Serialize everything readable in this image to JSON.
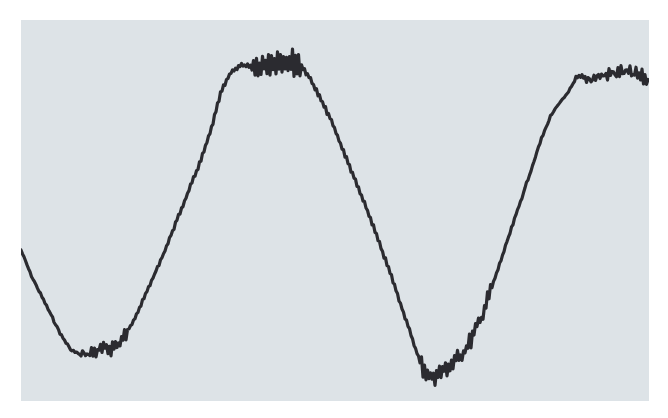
{
  "colors": {
    "page_background": "#ffffff",
    "panel_background": "#dde3e7",
    "trace": "#2b2b30"
  },
  "chart_data": {
    "type": "line",
    "title": "",
    "xlabel": "",
    "ylabel": "",
    "grid": false,
    "legend": null,
    "panel_px": {
      "x": 21,
      "y": 20,
      "width": 628,
      "height": 381
    },
    "series": [
      {
        "name": "trace",
        "points_px": [
          [
            0,
            230
          ],
          [
            10,
            255
          ],
          [
            20,
            275
          ],
          [
            30,
            295
          ],
          [
            40,
            315
          ],
          [
            50,
            330
          ],
          [
            60,
            335
          ],
          [
            70,
            333
          ],
          [
            80,
            330
          ],
          [
            90,
            328
          ],
          [
            100,
            322
          ],
          [
            110,
            305
          ],
          [
            120,
            285
          ],
          [
            130,
            262
          ],
          [
            140,
            240
          ],
          [
            150,
            215
          ],
          [
            160,
            190
          ],
          [
            170,
            165
          ],
          [
            180,
            140
          ],
          [
            190,
            110
          ],
          [
            200,
            72
          ],
          [
            210,
            52
          ],
          [
            220,
            45
          ],
          [
            235,
            48
          ],
          [
            250,
            42
          ],
          [
            265,
            40
          ],
          [
            280,
            45
          ],
          [
            290,
            60
          ],
          [
            300,
            80
          ],
          [
            310,
            100
          ],
          [
            320,
            125
          ],
          [
            330,
            150
          ],
          [
            340,
            175
          ],
          [
            350,
            200
          ],
          [
            360,
            228
          ],
          [
            370,
            255
          ],
          [
            380,
            285
          ],
          [
            390,
            315
          ],
          [
            400,
            345
          ],
          [
            410,
            358
          ],
          [
            420,
            352
          ],
          [
            430,
            345
          ],
          [
            440,
            335
          ],
          [
            450,
            320
          ],
          [
            460,
            298
          ],
          [
            470,
            270
          ],
          [
            480,
            240
          ],
          [
            490,
            210
          ],
          [
            500,
            180
          ],
          [
            510,
            150
          ],
          [
            520,
            120
          ],
          [
            530,
            95
          ],
          [
            545,
            75
          ],
          [
            555,
            60
          ],
          [
            570,
            58
          ],
          [
            585,
            55
          ],
          [
            600,
            52
          ],
          [
            615,
            55
          ],
          [
            628,
            60
          ]
        ],
        "noise_regions_px": [
          {
            "x_from": 60,
            "x_to": 105,
            "amplitude": 12
          },
          {
            "x_from": 230,
            "x_to": 280,
            "amplitude": 14
          },
          {
            "x_from": 400,
            "x_to": 470,
            "amplitude": 12
          },
          {
            "x_from": 555,
            "x_to": 628,
            "amplitude": 14
          }
        ]
      }
    ]
  }
}
